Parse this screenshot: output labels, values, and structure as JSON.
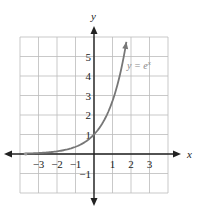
{
  "chart_data": {
    "type": "line",
    "title": "",
    "xlabel": "x",
    "ylabel": "y",
    "xlim": [
      -4,
      4
    ],
    "ylim": [
      -2,
      6
    ],
    "grid": true,
    "x_ticks": [
      -3,
      -2,
      -1,
      1,
      2,
      3
    ],
    "y_ticks": [
      5,
      4,
      3,
      2,
      1,
      -1
    ],
    "x_tick_labels": [
      "−3",
      "−2",
      "−1",
      "1",
      "2",
      "3"
    ],
    "y_tick_labels": [
      "5",
      "4",
      "3",
      "2",
      "1",
      "−1"
    ],
    "series": [
      {
        "name": "y = e^x",
        "label": "y = e",
        "label_superscript": "x",
        "function": "exp(x)",
        "x": [
          -3.8,
          -3,
          -2,
          -1,
          0,
          0.5,
          1,
          1.5,
          1.75
        ],
        "values": [
          0.02,
          0.05,
          0.14,
          0.37,
          1,
          1.65,
          2.72,
          4.48,
          5.75
        ],
        "color": "#777777"
      }
    ]
  },
  "labels": {
    "x_axis": "x",
    "y_axis": "y",
    "curve": "y = e",
    "curve_exp": "x"
  },
  "colors": {
    "grid": "#bbbbbb",
    "axis": "#222222",
    "curve": "#777777"
  }
}
